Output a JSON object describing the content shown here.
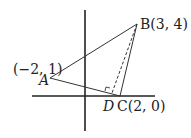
{
  "diagram": {
    "points": {
      "A": {
        "name": "A",
        "coord_label": "(−2, 1)"
      },
      "B": {
        "name": "B",
        "coord_label": "(3, 4)"
      },
      "C": {
        "name": "C",
        "coord_label": "(2, 0)"
      },
      "D": {
        "name": "D"
      }
    },
    "labels": {
      "A_coords": "(−2, 1)",
      "A": "A",
      "B": "B(3, 4)",
      "D": "D",
      "C": "C(2, 0)"
    },
    "colors": {
      "line": "#222222",
      "background": "#ffffff"
    }
  }
}
